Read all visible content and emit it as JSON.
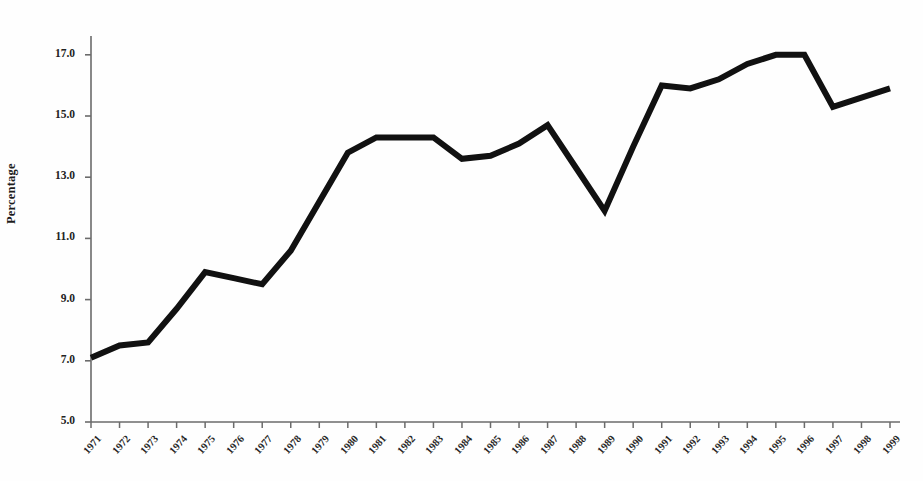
{
  "chart_data": {
    "type": "line",
    "title": "",
    "subtitle": "",
    "xlabel": "",
    "ylabel": "Percentage",
    "legend": [],
    "legend_position": "none",
    "grid": false,
    "xlim": [
      1971,
      1999
    ],
    "ylim": [
      5.0,
      17.8
    ],
    "yticks": [
      "5.0",
      "7.0",
      "9.0",
      "11.0",
      "13.0",
      "15.0",
      "17.0"
    ],
    "ytick_values": [
      5.0,
      7.0,
      9.0,
      11.0,
      13.0,
      15.0,
      17.0
    ],
    "categories": [
      "1971",
      "1972",
      "1973",
      "1974",
      "1975",
      "1976",
      "1977",
      "1978",
      "1979",
      "1980",
      "1981",
      "1982",
      "1983",
      "1984",
      "1985",
      "1986",
      "1987",
      "1988",
      "1989",
      "1990",
      "1991",
      "1992",
      "1993",
      "1994",
      "1995",
      "1996",
      "1997",
      "1998",
      "1999"
    ],
    "values": [
      7.1,
      7.5,
      7.6,
      8.7,
      9.9,
      9.7,
      9.5,
      10.6,
      12.2,
      13.8,
      14.3,
      14.3,
      14.3,
      13.6,
      13.7,
      14.1,
      14.7,
      13.3,
      11.9,
      14.0,
      16.0,
      15.9,
      16.2,
      16.7,
      17.0,
      17.0,
      15.3,
      15.6,
      15.9
    ],
    "series": [
      {
        "name": "Percentage",
        "color": "#111111",
        "line_width": 6,
        "marker": "none",
        "values": [
          7.1,
          7.5,
          7.6,
          8.7,
          9.9,
          9.7,
          9.5,
          10.6,
          12.2,
          13.8,
          14.3,
          14.3,
          14.3,
          13.6,
          13.7,
          14.1,
          14.7,
          13.3,
          11.9,
          14.0,
          16.0,
          15.9,
          16.2,
          16.7,
          17.0,
          17.0,
          15.3,
          15.6,
          15.9
        ]
      }
    ],
    "annotations": []
  },
  "axes": {
    "axis_color": "#6b6b6b",
    "line_color": "#111111",
    "background": "#ffffff",
    "y_axis_label": "Percentage"
  }
}
